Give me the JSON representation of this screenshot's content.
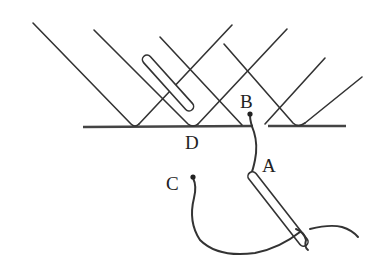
{
  "diagram": {
    "type": "physics-reflection-illustration",
    "labels": {
      "A": "A",
      "B": "B",
      "C": "C",
      "D": "D"
    },
    "colors": {
      "ink": "#333333",
      "background": "#ffffff"
    },
    "elements": [
      {
        "id": "incident-rays",
        "description": "parallel rays slanting down-right to the surface"
      },
      {
        "id": "reflected-rays",
        "description": "rays reflecting up-right from the surface"
      },
      {
        "id": "surface",
        "description": "horizontal reflecting surface with a gap near B"
      },
      {
        "id": "upper-rod",
        "description": "slanted rounded rod above surface near D"
      },
      {
        "id": "lower-rod",
        "description": "slanted rounded rod below surface starting at A"
      },
      {
        "id": "wire-B-A",
        "description": "wire from point B down to A"
      },
      {
        "id": "wire-C",
        "description": "wire from point C looping to lower rod end"
      }
    ]
  }
}
